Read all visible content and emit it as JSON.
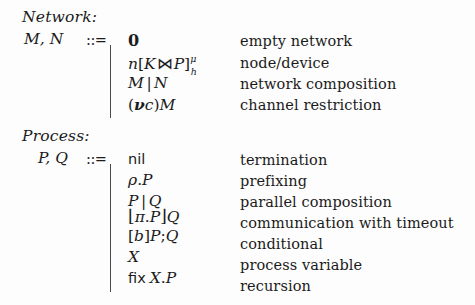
{
  "figure": {
    "kind": "bnf-grammar",
    "sections": [
      {
        "id": "network",
        "header": "Network:",
        "nonterminal": "M, N",
        "defeq": "::=",
        "productions": [
          {
            "syntax": "0",
            "description": "empty network"
          },
          {
            "syntax": "n[I⋈P]μ h",
            "description": "node/device"
          },
          {
            "syntax": "M | N",
            "description": "network composition"
          },
          {
            "syntax": "(νc)M",
            "description": "channel restriction"
          }
        ]
      },
      {
        "id": "process",
        "header": "Process:",
        "nonterminal": "P, Q",
        "defeq": "::=",
        "productions": [
          {
            "syntax": "nil",
            "description": "termination"
          },
          {
            "syntax": "ρ.P",
            "description": "prefixing"
          },
          {
            "syntax": "P | Q",
            "description": "parallel composition"
          },
          {
            "syntax": "⌊π.P⌋Q",
            "description": "communication with timeout"
          },
          {
            "syntax": "[b]P;Q",
            "description": "conditional"
          },
          {
            "syntax": "X",
            "description": "process variable"
          },
          {
            "syntax": "fix X.P",
            "description": "recursion"
          }
        ]
      }
    ],
    "symbols": {
      "empty_network": "0",
      "node": "n",
      "interface": "ℐ",
      "bowtie": "⋈",
      "process": "P",
      "mobility_sup": "μ",
      "location_sub": "h",
      "restriction_nu": "ν",
      "channel": "c",
      "nil": "nil",
      "rho": "ρ",
      "pi": "π",
      "floor_left": "⌊",
      "floor_right": "⌋",
      "boolean": "b",
      "variable": "X",
      "fix": "fix"
    },
    "colors": {
      "background": "#fdfdfd",
      "text": "#1b1b1b",
      "rule": "#4a4a4a"
    }
  }
}
